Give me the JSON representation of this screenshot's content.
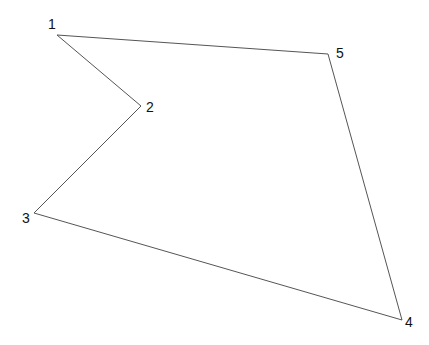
{
  "diagram": {
    "type": "polygon",
    "width": 429,
    "height": 345,
    "background": "#ffffff",
    "line_color": "#555555",
    "label_color": "#111111",
    "vertices": [
      {
        "id": "1",
        "label": "1",
        "x": 57,
        "y": 35,
        "label_x": 48,
        "label_y": 29
      },
      {
        "id": "2",
        "label": "2",
        "x": 141,
        "y": 106,
        "label_x": 146,
        "label_y": 112
      },
      {
        "id": "3",
        "label": "3",
        "x": 34,
        "y": 213,
        "label_x": 22,
        "label_y": 223
      },
      {
        "id": "4",
        "label": "4",
        "x": 402,
        "y": 320,
        "label_x": 405,
        "label_y": 327
      },
      {
        "id": "5",
        "label": "5",
        "x": 328,
        "y": 54,
        "label_x": 336,
        "label_y": 58
      }
    ],
    "edges": [
      [
        "1",
        "2"
      ],
      [
        "2",
        "3"
      ],
      [
        "3",
        "4"
      ],
      [
        "4",
        "5"
      ],
      [
        "5",
        "1"
      ]
    ]
  }
}
